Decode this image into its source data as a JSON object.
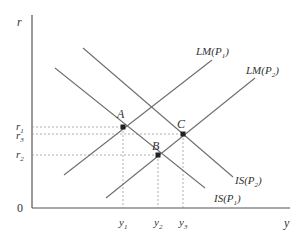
{
  "diagram": {
    "axes": {
      "y_label": "r",
      "x_label": "y",
      "origin_label": "0"
    },
    "curves": [
      {
        "id": "is_p1",
        "label": "IS(P",
        "sub": "1",
        "close": ")"
      },
      {
        "id": "is_p2",
        "label": "IS(P",
        "sub": "2",
        "close": ")"
      },
      {
        "id": "lm_p1",
        "label": "LM(P",
        "sub": "1",
        "close": ")"
      },
      {
        "id": "lm_p2",
        "label": "LM(P",
        "sub": "2",
        "close": ")"
      }
    ],
    "points": [
      {
        "id": "A",
        "label": "A",
        "desc": "IS(P1) ∩ LM(P1)",
        "r": "r1",
        "y": "y1"
      },
      {
        "id": "B",
        "label": "B",
        "desc": "IS(P1) ∩ LM(P2)",
        "r": "r2",
        "y": "y2"
      },
      {
        "id": "C",
        "label": "C",
        "desc": "IS(P2) ∩ LM(P2)",
        "r": "r3",
        "y": "y3"
      }
    ],
    "y_ticks": [
      {
        "base": "r",
        "sub": "1"
      },
      {
        "base": "r",
        "sub": "3"
      },
      {
        "base": "r",
        "sub": "2"
      }
    ],
    "x_ticks": [
      {
        "base": "y",
        "sub": "1"
      },
      {
        "base": "y",
        "sub": "2"
      },
      {
        "base": "y",
        "sub": "3"
      }
    ],
    "colors": {
      "line": "#6e6e6e",
      "axis": "#555555",
      "dashed": "#9a9a9a",
      "point": "#222222",
      "text": "#333333"
    }
  }
}
